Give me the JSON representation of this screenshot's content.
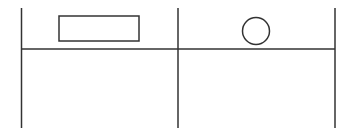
{
  "diagram": {
    "type": "two-column table sketch",
    "stroke_color": "#333333",
    "background": "#ffffff",
    "columns": [
      {
        "index": 0,
        "header_shape": "rectangle"
      },
      {
        "index": 1,
        "header_shape": "circle"
      }
    ],
    "geometry": {
      "vertical_lines_x": [
        21.5,
        178,
        335
      ],
      "vertical_top": 8,
      "vertical_bottom": 128,
      "header_divider_y": 49,
      "rectangle": {
        "x": 59,
        "y": 16,
        "width": 80,
        "height": 25
      },
      "circle": {
        "cx": 256,
        "cy": 31,
        "r": 13.5
      }
    }
  }
}
